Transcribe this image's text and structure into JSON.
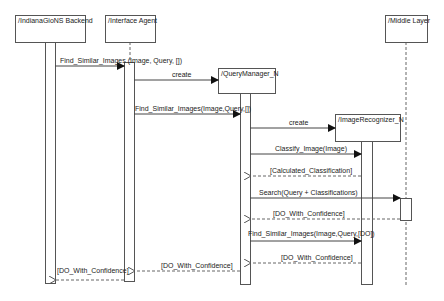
{
  "diagram": {
    "type": "sequence",
    "participants": [
      {
        "id": "backend",
        "label": "/IndianaGioNS Backend"
      },
      {
        "id": "interface",
        "label": "/Interface Agent"
      },
      {
        "id": "querymanager",
        "label": "/QueryManager_N"
      },
      {
        "id": "imagerecognizer",
        "label": "/ImageRecognizer_N"
      },
      {
        "id": "middle",
        "label": "/Middle Layer"
      }
    ],
    "messages": [
      {
        "from": "backend",
        "to": "interface",
        "label": "Find_Similar_Images (Image, Query, [])",
        "kind": "call"
      },
      {
        "from": "interface",
        "to": "querymanager",
        "label": "create",
        "kind": "create"
      },
      {
        "from": "interface",
        "to": "querymanager",
        "label": "Find_Similar_Images(Image,Query,[])",
        "kind": "call"
      },
      {
        "from": "querymanager",
        "to": "imagerecognizer",
        "label": "create",
        "kind": "create"
      },
      {
        "from": "querymanager",
        "to": "imagerecognizer",
        "label": "Classify_Image(Image)",
        "kind": "call"
      },
      {
        "from": "imagerecognizer",
        "to": "querymanager",
        "label": "[Calculated_Classification]",
        "kind": "return"
      },
      {
        "from": "querymanager",
        "to": "middle",
        "label": "Search(Query + Classifications)",
        "kind": "call"
      },
      {
        "from": "middle",
        "to": "querymanager",
        "label": "[DO_With_Confidence]",
        "kind": "return"
      },
      {
        "from": "querymanager",
        "to": "imagerecognizer",
        "label": "Find_Similar_Images(Image,Query,[DO])",
        "kind": "call"
      },
      {
        "from": "imagerecognizer",
        "to": "querymanager",
        "label": "[DO_With_Confidence]",
        "kind": "return"
      },
      {
        "from": "querymanager",
        "to": "interface",
        "label": "[DO_With_Confidence]",
        "kind": "return"
      },
      {
        "from": "interface",
        "to": "backend",
        "label": "[DO_With_Confidence]",
        "kind": "return"
      }
    ]
  }
}
